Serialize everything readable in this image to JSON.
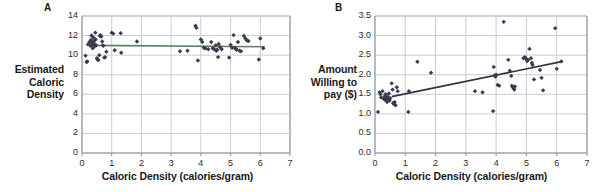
{
  "figure": {
    "background": "#ffffff",
    "point_color": "#3a3a4d",
    "gridline_color": "#c9cdd4",
    "axis_color": "#8a8f98"
  },
  "panels": [
    {
      "letter": "A",
      "y_axis_title_lines": [
        "Estimated",
        "Caloric",
        "Density"
      ],
      "x_axis_title": "Caloric Density (calories/gram)",
      "chart_ref": 0
    },
    {
      "letter": "B",
      "y_axis_title_lines": [
        "Amount",
        "Willing to",
        "pay ($)"
      ],
      "x_axis_title": "Caloric Density (calories/gram)",
      "chart_ref": 1
    }
  ],
  "chart_data": [
    {
      "type": "scatter",
      "title": "A",
      "xlabel": "Caloric Density (calories/gram)",
      "ylabel": "Estimated Caloric Density",
      "xlim": [
        0,
        7
      ],
      "ylim": [
        0,
        14
      ],
      "xticks": [
        0,
        1,
        2,
        3,
        4,
        5,
        6,
        7
      ],
      "xtick_labels": [
        "0",
        "1",
        "2",
        "3",
        "4",
        "5",
        "6",
        "7"
      ],
      "yticks": [
        0,
        2,
        4,
        6,
        8,
        10,
        12,
        14
      ],
      "ytick_labels": [
        "0",
        "2",
        "4",
        "6",
        "8",
        "10",
        "12",
        "14"
      ],
      "grid": true,
      "legend": "none",
      "marker": "diamond",
      "marker_color": "#3a3a4d",
      "trendline": {
        "type": "flat",
        "color": "#5f7f63",
        "x_start": 0.25,
        "x_end": 6.15,
        "y_start": 11.0,
        "y_end": 10.85
      },
      "points": [
        [
          0.12,
          9.95
        ],
        [
          0.15,
          9.3
        ],
        [
          0.18,
          9.35
        ],
        [
          0.2,
          11.1
        ],
        [
          0.25,
          11.35
        ],
        [
          0.28,
          10.95
        ],
        [
          0.3,
          11.55
        ],
        [
          0.32,
          12.0
        ],
        [
          0.33,
          11.25
        ],
        [
          0.35,
          11.05
        ],
        [
          0.36,
          10.7
        ],
        [
          0.38,
          11.8
        ],
        [
          0.4,
          11.45
        ],
        [
          0.42,
          11.15
        ],
        [
          0.43,
          10.9
        ],
        [
          0.45,
          12.3
        ],
        [
          0.46,
          11.6
        ],
        [
          0.48,
          11.0
        ],
        [
          0.5,
          9.7
        ],
        [
          0.52,
          9.55
        ],
        [
          0.55,
          9.5
        ],
        [
          0.58,
          10.0
        ],
        [
          0.6,
          11.95
        ],
        [
          0.62,
          12.05
        ],
        [
          0.65,
          11.9
        ],
        [
          0.68,
          11.4
        ],
        [
          0.7,
          11.0
        ],
        [
          0.72,
          10.95
        ],
        [
          0.75,
          9.75
        ],
        [
          0.78,
          9.8
        ],
        [
          0.82,
          10.35
        ],
        [
          1.0,
          12.3
        ],
        [
          1.05,
          12.2
        ],
        [
          1.1,
          10.5
        ],
        [
          1.3,
          12.25
        ],
        [
          1.32,
          10.25
        ],
        [
          1.85,
          11.4
        ],
        [
          3.3,
          10.4
        ],
        [
          3.55,
          10.45
        ],
        [
          3.82,
          13.0
        ],
        [
          3.85,
          12.8
        ],
        [
          3.9,
          9.45
        ],
        [
          4.0,
          11.6
        ],
        [
          4.05,
          11.35
        ],
        [
          4.1,
          10.75
        ],
        [
          4.15,
          10.7
        ],
        [
          4.25,
          10.6
        ],
        [
          4.35,
          11.35
        ],
        [
          4.4,
          10.7
        ],
        [
          4.45,
          10.6
        ],
        [
          4.5,
          11.0
        ],
        [
          4.52,
          10.45
        ],
        [
          4.55,
          10.55
        ],
        [
          4.58,
          9.8
        ],
        [
          4.6,
          11.15
        ],
        [
          4.65,
          10.8
        ],
        [
          4.7,
          10.6
        ],
        [
          4.95,
          9.75
        ],
        [
          5.0,
          11.05
        ],
        [
          5.05,
          10.75
        ],
        [
          5.1,
          12.05
        ],
        [
          5.15,
          10.7
        ],
        [
          5.18,
          10.65
        ],
        [
          5.2,
          10.55
        ],
        [
          5.25,
          11.35
        ],
        [
          5.3,
          10.45
        ],
        [
          5.35,
          10.4
        ],
        [
          5.45,
          11.95
        ],
        [
          5.5,
          11.7
        ],
        [
          5.55,
          11.5
        ],
        [
          5.6,
          11.45
        ],
        [
          5.95,
          9.55
        ],
        [
          6.0,
          11.7
        ],
        [
          6.1,
          10.7
        ]
      ]
    },
    {
      "type": "scatter",
      "title": "B",
      "xlabel": "Caloric Density (calories/gram)",
      "ylabel": "Amount Willing to pay ($)",
      "xlim": [
        0,
        7
      ],
      "ylim": [
        0.0,
        3.5
      ],
      "xticks": [
        0,
        1,
        2,
        3,
        4,
        5,
        6,
        7
      ],
      "xtick_labels": [
        "0",
        "1",
        "2",
        "3",
        "4",
        "5",
        "6",
        "7"
      ],
      "yticks": [
        0.0,
        0.5,
        1.0,
        1.5,
        2.0,
        2.5,
        3.0,
        3.5
      ],
      "ytick_labels": [
        "0.0",
        "0.5",
        "1.0",
        "1.5",
        "2.0",
        "2.5",
        "3.0",
        "3.5"
      ],
      "grid": true,
      "legend": "none",
      "marker": "diamond",
      "marker_color": "#3a3a4d",
      "trendline": {
        "type": "linear",
        "color": "#2f3440",
        "x_start": 0.55,
        "x_end": 6.2,
        "y_start": 1.44,
        "y_end": 2.34
      },
      "points": [
        [
          0.1,
          1.05
        ],
        [
          0.15,
          1.55
        ],
        [
          0.18,
          1.5
        ],
        [
          0.2,
          1.42
        ],
        [
          0.25,
          1.58
        ],
        [
          0.28,
          1.4
        ],
        [
          0.3,
          1.38
        ],
        [
          0.32,
          1.45
        ],
        [
          0.34,
          1.35
        ],
        [
          0.35,
          1.5
        ],
        [
          0.36,
          1.42
        ],
        [
          0.38,
          1.36
        ],
        [
          0.4,
          1.3
        ],
        [
          0.42,
          1.44
        ],
        [
          0.44,
          1.38
        ],
        [
          0.46,
          1.52
        ],
        [
          0.48,
          1.34
        ],
        [
          0.5,
          1.4
        ],
        [
          0.55,
          1.78
        ],
        [
          0.58,
          1.62
        ],
        [
          0.6,
          1.28
        ],
        [
          0.62,
          1.25
        ],
        [
          0.65,
          1.3
        ],
        [
          0.68,
          1.22
        ],
        [
          0.72,
          1.68
        ],
        [
          0.75,
          1.58
        ],
        [
          1.1,
          1.05
        ],
        [
          1.12,
          1.58
        ],
        [
          1.4,
          2.33
        ],
        [
          1.85,
          2.05
        ],
        [
          3.3,
          1.58
        ],
        [
          3.55,
          1.55
        ],
        [
          3.9,
          1.07
        ],
        [
          3.92,
          2.2
        ],
        [
          3.95,
          1.98
        ],
        [
          3.98,
          1.95
        ],
        [
          4.0,
          2.0
        ],
        [
          4.05,
          1.74
        ],
        [
          4.1,
          1.72
        ],
        [
          4.25,
          3.35
        ],
        [
          4.4,
          2.38
        ],
        [
          4.45,
          2.1
        ],
        [
          4.5,
          1.97
        ],
        [
          4.52,
          1.72
        ],
        [
          4.55,
          1.68
        ],
        [
          4.58,
          1.65
        ],
        [
          4.6,
          1.62
        ],
        [
          4.62,
          1.7
        ],
        [
          4.9,
          2.42
        ],
        [
          4.95,
          2.45
        ],
        [
          5.0,
          2.4
        ],
        [
          5.02,
          2.35
        ],
        [
          5.05,
          2.38
        ],
        [
          5.1,
          2.66
        ],
        [
          5.15,
          2.42
        ],
        [
          5.18,
          2.3
        ],
        [
          5.2,
          2.25
        ],
        [
          5.25,
          1.88
        ],
        [
          5.45,
          2.12
        ],
        [
          5.5,
          1.92
        ],
        [
          5.55,
          1.6
        ],
        [
          5.95,
          3.19
        ],
        [
          6.0,
          2.15
        ],
        [
          6.15,
          2.34
        ]
      ]
    }
  ]
}
